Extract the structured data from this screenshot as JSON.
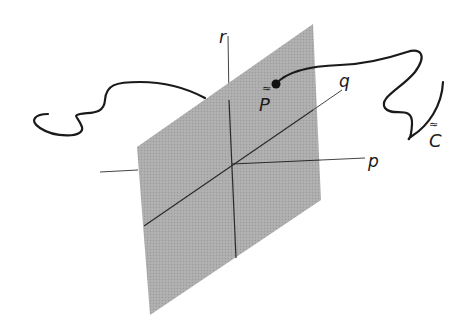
{
  "diagram": {
    "type": "3d-coordinate-plane-with-curve",
    "colors": {
      "plane_fill": "#a9a9a9",
      "axis": "#2a2a2a",
      "curve": "#1a1a1a",
      "background": "#ffffff"
    },
    "axes": {
      "p": {
        "label": "p"
      },
      "q": {
        "label": "q"
      },
      "r": {
        "label": "r"
      }
    },
    "point": {
      "label": "P",
      "accent": "≈"
    },
    "curve": {
      "label": "C",
      "accent": "≈"
    }
  }
}
